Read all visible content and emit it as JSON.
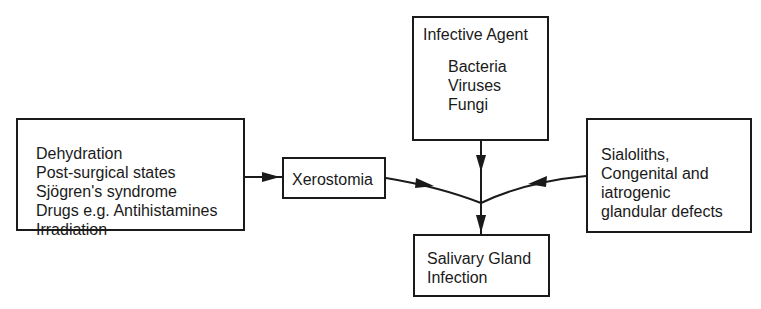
{
  "diagram": {
    "causes_box": {
      "items": [
        "Dehydration",
        "Post-surgical states",
        "Sjögren's syndrome",
        "Drugs e.g. Antihistamines",
        "Irradiation"
      ]
    },
    "xerostomia_box": {
      "label": "Xerostomia"
    },
    "agent_box": {
      "title": "Infective Agent",
      "items": [
        "Bacteria",
        "Viruses",
        "Fungi"
      ]
    },
    "local_box": {
      "items": [
        "Sialoliths,",
        "Congenital and",
        "iatrogenic",
        "glandular defects"
      ]
    },
    "outcome_box": {
      "items": [
        "Salivary Gland",
        "Infection"
      ]
    },
    "edges": [
      {
        "from": "causes_box",
        "to": "xerostomia_box"
      },
      {
        "from": "xerostomia_box",
        "to": "junction"
      },
      {
        "from": "agent_box",
        "to": "junction"
      },
      {
        "from": "local_box",
        "to": "junction"
      },
      {
        "from": "junction",
        "to": "outcome_box"
      }
    ],
    "colors": {
      "line": "#1a1a1a",
      "background": "#ffffff"
    }
  }
}
